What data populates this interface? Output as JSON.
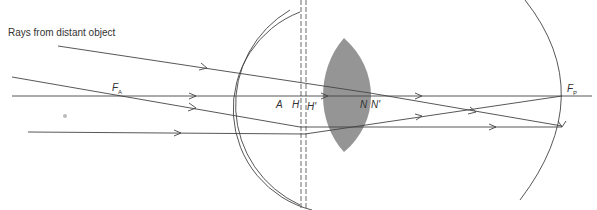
{
  "diagram": {
    "caption": "Rays from distant object",
    "labels": {
      "F_A": {
        "main": "F",
        "sub": "A"
      },
      "A": "A",
      "H": "H",
      "H_prime": "H'",
      "N": "N",
      "N_prime": "N'",
      "F_P": {
        "main": "F",
        "sub": "P"
      }
    },
    "colors": {
      "lens_fill": "#8a8a8a",
      "line": "#444444",
      "background": "#ffffff"
    }
  }
}
